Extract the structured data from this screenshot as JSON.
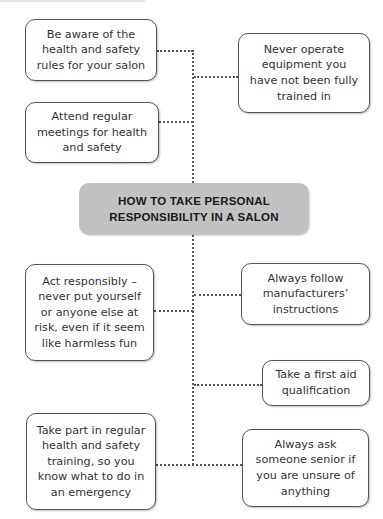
{
  "title": "HOW TO TAKE PERSONAL\nRESPONSIBILITY IN A SALON",
  "nodes": [
    {
      "id": "aware-rules",
      "side": "left",
      "text": "Be aware of the\nhealth and safety\nrules for your salon"
    },
    {
      "id": "never-operate",
      "side": "right",
      "text": "Never operate\nequipment you\nhave not been fully\ntrained in"
    },
    {
      "id": "attend-meetings",
      "side": "left",
      "text": "Attend regular\nmeetings for health\nand safety"
    },
    {
      "id": "act-responsibly",
      "side": "left",
      "text": "Act responsibly –\nnever put yourself\nor anyone else at\nrisk, even if it seem\nlike harmless fun"
    },
    {
      "id": "follow-instructions",
      "side": "right",
      "text": "Always follow\nmanufacturers’\ninstructions"
    },
    {
      "id": "first-aid",
      "side": "right",
      "text": "Take a first aid\nqualification"
    },
    {
      "id": "training",
      "side": "left",
      "text": "Take part in regular\nhealth and safety\ntraining, so you\nknow what to do in\nan emergency"
    },
    {
      "id": "ask-senior",
      "side": "right",
      "text": "Always ask\nsomeone senior if\nyou are unsure of\nanything"
    }
  ],
  "colors": {
    "center_fill": "#c2c2c2",
    "border": "#555555",
    "connector": "#555555",
    "text": "#333333"
  }
}
